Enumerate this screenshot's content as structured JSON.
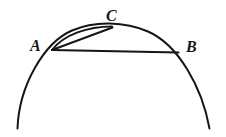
{
  "figure": {
    "background_color": "#ffffff",
    "stroke_color": "#161616",
    "labels": {
      "A": "A",
      "B": "B",
      "C": "C"
    },
    "points": {
      "A": {
        "x": 52,
        "y": 50
      },
      "B": {
        "x": 178,
        "y": 52
      },
      "C": {
        "x": 112,
        "y": 27
      }
    },
    "elements": {
      "major_arc_name": "major-circle-arc",
      "minor_arc_name": "arc-A-to-C",
      "chord_ac_name": "chord-A-to-C",
      "chord_ab_name": "chord-A-to-B"
    }
  }
}
